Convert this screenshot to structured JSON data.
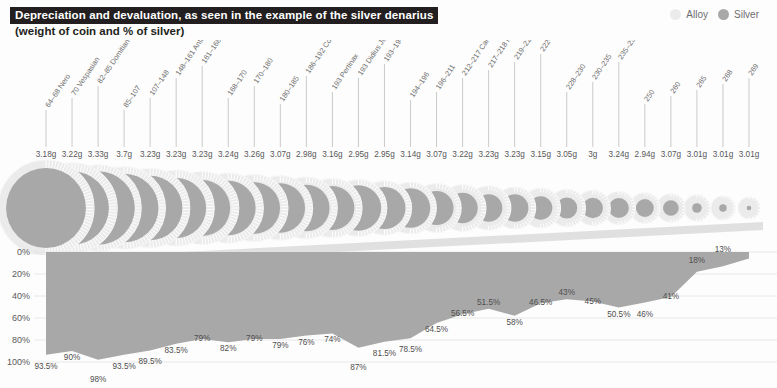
{
  "header": {
    "title": "Depreciation and devaluation, as seen in the example of the silver denarius",
    "subtitle": "(weight of coin and % of silver)"
  },
  "legend": {
    "items": [
      {
        "label": "Alloy",
        "color": "#ebebeb"
      },
      {
        "label": "Silver",
        "color": "#a8a8a8"
      }
    ]
  },
  "axis": {
    "y_ticks": [
      "0%",
      "20%",
      "40%",
      "60%",
      "80%",
      "100%"
    ],
    "y_values": [
      0,
      20,
      40,
      60,
      80,
      100
    ]
  },
  "chart_data": {
    "type": "area",
    "title": "Depreciation and devaluation, as seen in the example of the silver denarius",
    "subtitle": "(weight of coin and % of silver)",
    "xlabel": "",
    "ylabel": "% of silver",
    "ylim": [
      0,
      100
    ],
    "y_inverted": true,
    "grid": true,
    "legend_position": "top-right",
    "categories": [
      "64–68 Nero",
      "70 Vespasian",
      "82–85 Domitian",
      "85–107",
      "107–148",
      "148–161 Antoninus Pius",
      "161–168 Lucius Verus",
      "168–170",
      "170–180",
      "180–185",
      "186–192 Commodus",
      "193 Pertinax",
      "193 Didius Julianus",
      "193–194 Septimius Severus",
      "194–196",
      "196–211",
      "212–217 Caracalla",
      "217–218 Macrinus",
      "219–222 Elagabalus",
      "222–228 Severus Alexander",
      "228–230",
      "230–235",
      "235–238 Maximinus Thrax",
      "250",
      "260",
      "265",
      "268",
      "269"
    ],
    "weights": [
      "3.18g",
      "3.22g",
      "3.33g",
      "3.7g",
      "3.23g",
      "3.23g",
      "3.23g",
      "3.24g",
      "3.26g",
      "3.07g",
      "2.98g",
      "3.16g",
      "2.95g",
      "2.95g",
      "3.14g",
      "3.07g",
      "3.22g",
      "3.23g",
      "3.23g",
      "3.15g",
      "3.05g",
      "3g",
      "3.24g",
      "2.94g",
      "3.07g",
      "3.01g",
      "3.01g",
      "3.01g"
    ],
    "series": [
      {
        "name": "Silver",
        "color": "#a8a8a8",
        "values": [
          93.5,
          90,
          98,
          93.5,
          89.5,
          83.5,
          79,
          82,
          79,
          79,
          76,
          74,
          87,
          81.5,
          78.5,
          64.5,
          56.5,
          51.5,
          58,
          46.5,
          43,
          45,
          50.5,
          46,
          41,
          18,
          13,
          6
        ]
      },
      {
        "name": "Alloy",
        "color": "#ebebeb"
      }
    ],
    "labels": [
      "93.5%",
      "90%",
      "98%",
      "93.5%",
      "89.5%",
      "83.5%",
      "79%",
      "82%",
      "79%",
      "79%",
      "76%",
      "74%",
      "87%",
      "81.5%",
      "78.5%",
      "64.5%",
      "56.5%",
      "51.5%",
      "58%",
      "46.5%",
      "43%",
      "45%",
      "50.5%",
      "46%",
      "41%",
      "18%",
      "13%",
      "6%",
      "2%"
    ]
  },
  "colors": {
    "title_bg": "#231f20",
    "title_fg": "#ffffff",
    "silver": "#a8a8a8",
    "alloy": "#ebebeb",
    "background": "#fdfdfd",
    "grid": "#e2e2e2"
  }
}
